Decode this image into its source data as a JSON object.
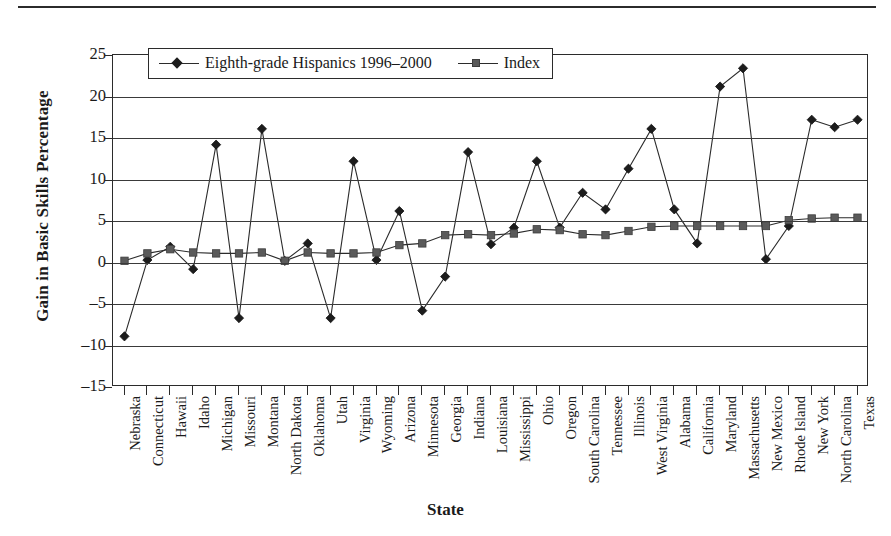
{
  "page": {
    "has_top_rule": true
  },
  "chart_data": {
    "type": "line",
    "title": "",
    "xlabel": "State",
    "ylabel": "Gain in Basic Skills Percentage",
    "ylim": [
      -15,
      25
    ],
    "yticks": [
      25,
      20,
      15,
      10,
      5,
      0,
      -5,
      -10,
      -15
    ],
    "ytick_labels": [
      "25",
      "20",
      "15",
      "10",
      "5",
      "0",
      "–5",
      "–10",
      "–15"
    ],
    "grid": true,
    "legend_position": "top-left-inside",
    "categories": [
      "Nebraska",
      "Connecticut",
      "Hawaii",
      "Idaho",
      "Michigan",
      "Missouri",
      "Montana",
      "North Dakota",
      "Oklahoma",
      "Utah",
      "Virginia",
      "Wyoming",
      "Arizona",
      "Minnesota",
      "Georgia",
      "Indiana",
      "Louisiana",
      "Mississippi",
      "Ohio",
      "Oregon",
      "South Carolina",
      "Tennessee",
      "Illinois",
      "West Virginia",
      "Alabama",
      "California",
      "Maryland",
      "Massachusetts",
      "New Mexico",
      "Rhode Island",
      "New York",
      "North Carolina",
      "Texas"
    ],
    "series": [
      {
        "name": "Eighth-grade Hispanics 1996–2000",
        "marker": "diamond",
        "color": "#1c1c1c",
        "values": [
          -8.9,
          0.3,
          1.9,
          -0.8,
          14.2,
          -6.7,
          16.1,
          0.2,
          2.3,
          -6.7,
          12.2,
          0.3,
          6.2,
          -5.8,
          -1.7,
          13.3,
          2.2,
          4.2,
          12.2,
          4.2,
          8.4,
          6.4,
          11.3,
          16.1,
          6.4,
          2.3,
          21.2,
          23.4,
          0.4,
          4.4,
          17.2,
          16.3,
          17.2
        ]
      },
      {
        "name": "Index",
        "marker": "square",
        "color": "#5a5a5a",
        "values": [
          0.2,
          1.1,
          1.6,
          1.2,
          1.1,
          1.1,
          1.2,
          0.2,
          1.2,
          1.1,
          1.1,
          1.2,
          2.1,
          2.3,
          3.3,
          3.4,
          3.3,
          3.5,
          4.0,
          3.9,
          3.4,
          3.3,
          3.8,
          4.3,
          4.4,
          4.4,
          4.4,
          4.4,
          4.4,
          5.1,
          5.3,
          5.4,
          5.4
        ]
      }
    ]
  }
}
